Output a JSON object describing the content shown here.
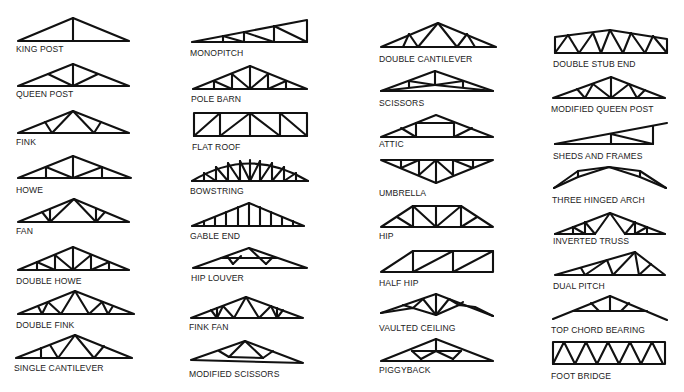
{
  "figure": {
    "caption_visible": "cropped / illegible",
    "columns": [
      {
        "items": [
          {
            "label": "KING POST"
          },
          {
            "label": "QUEEN POST"
          },
          {
            "label": "FINK"
          },
          {
            "label": "HOWE"
          },
          {
            "label": "FAN"
          },
          {
            "label": "DOUBLE HOWE"
          },
          {
            "label": "DOUBLE FINK"
          },
          {
            "label": "SINGLE CANTILEVER"
          }
        ]
      },
      {
        "items": [
          {
            "label": "MONOPITCH"
          },
          {
            "label": "POLE BARN"
          },
          {
            "label": "FLAT ROOF"
          },
          {
            "label": "BOWSTRING"
          },
          {
            "label": "GABLE END"
          },
          {
            "label": "HIP LOUVER"
          },
          {
            "label": "FINK FAN"
          },
          {
            "label": "MODIFIED SCISSORS"
          }
        ]
      },
      {
        "items": [
          {
            "label": "DOUBLE CANTILEVER"
          },
          {
            "label": "SCISSORS"
          },
          {
            "label": "ATTIC"
          },
          {
            "label": "UMBRELLA"
          },
          {
            "label": "HIP"
          },
          {
            "label": "HALF HIP"
          },
          {
            "label": "VAULTED CEILING"
          },
          {
            "label": "PIGGYBACK"
          }
        ]
      },
      {
        "items": [
          {
            "label": "DOUBLE STUB END"
          },
          {
            "label": "MODIFIED QUEEN POST"
          },
          {
            "label": "SHEDS AND FRAMES"
          },
          {
            "label": "THREE HINGED ARCH"
          },
          {
            "label": "INVERTED TRUSS"
          },
          {
            "label": "DUAL PITCH"
          },
          {
            "label": "TOP CHORD BEARING"
          },
          {
            "label": "FOOT BRIDGE"
          }
        ]
      }
    ]
  }
}
